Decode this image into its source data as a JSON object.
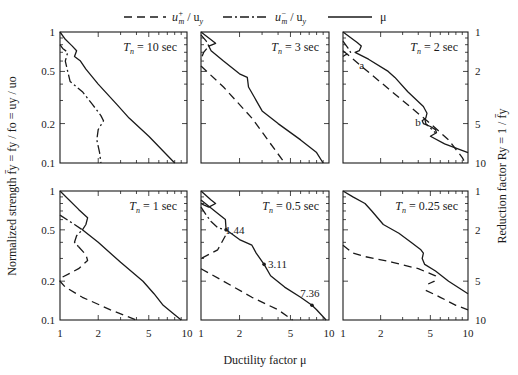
{
  "chart_data": {
    "type": "line",
    "title": "",
    "layout": {
      "rows": 2,
      "cols": 3,
      "xscale": "log",
      "yscale": "log",
      "grid": false,
      "legend_position": "top"
    },
    "legend": [
      {
        "label_main": "u",
        "label_sup": "+",
        "label_sub": "m",
        "label_tail": " / u",
        "label_tail_sub": "y",
        "style": "dashed",
        "name": "u_m+/u_y"
      },
      {
        "label_main": "u",
        "label_sup": "−",
        "label_sub": "m",
        "label_tail": " / u",
        "label_tail_sub": "y",
        "style": "dashdot",
        "name": "u_m-/u_y"
      },
      {
        "label_main": "μ",
        "style": "solid",
        "name": "mu"
      }
    ],
    "xlabel": "Ductility factor μ",
    "ylabel_left": "Normalized strength f̄y = fy / fo = uy / uo",
    "ylabel_right": "Reduction factor Ry = 1 / f̄y",
    "xlim": [
      1,
      10
    ],
    "ylim": [
      0.1,
      1
    ],
    "x_ticks": [
      "1",
      "2",
      "5",
      "10"
    ],
    "y_ticks_left": [
      "1",
      "0.5",
      "0.2",
      "0.1"
    ],
    "y_ticks_right": [
      "1",
      "2",
      "5",
      "10"
    ],
    "panels": [
      {
        "title": "T_n = 10 sec",
        "tn": "10 sec",
        "series": [
          {
            "name": "mu",
            "style": "solid",
            "points": [
              [
                1.0,
                1.0
              ],
              [
                1.1,
                0.88
              ],
              [
                1.25,
                0.78
              ],
              [
                1.35,
                0.72
              ],
              [
                1.3,
                0.65
              ],
              [
                1.45,
                0.6
              ],
              [
                1.6,
                0.52
              ],
              [
                2.0,
                0.4
              ],
              [
                2.8,
                0.28
              ],
              [
                3.5,
                0.22
              ],
              [
                5.0,
                0.16
              ],
              [
                8.0,
                0.1
              ]
            ]
          },
          {
            "name": "u_m-/u_y",
            "style": "dashdot",
            "points": [
              [
                1.0,
                0.8
              ],
              [
                1.05,
                0.75
              ],
              [
                1.15,
                0.7
              ],
              [
                1.1,
                0.6
              ],
              [
                1.15,
                0.5
              ],
              [
                1.2,
                0.42
              ],
              [
                1.5,
                0.35
              ],
              [
                1.8,
                0.28
              ],
              [
                2.1,
                0.23
              ],
              [
                2.2,
                0.21
              ],
              [
                2.0,
                0.18
              ],
              [
                1.95,
                0.15
              ],
              [
                2.05,
                0.12
              ],
              [
                2.1,
                0.1
              ]
            ]
          }
        ]
      },
      {
        "title": "T_n = 3 sec",
        "tn": "3 sec",
        "series": [
          {
            "name": "mu",
            "style": "solid",
            "points": [
              [
                1.0,
                1.0
              ],
              [
                1.3,
                0.82
              ],
              [
                1.15,
                0.78
              ],
              [
                1.2,
                0.72
              ],
              [
                1.5,
                0.6
              ],
              [
                2.0,
                0.48
              ],
              [
                2.3,
                0.45
              ],
              [
                2.35,
                0.38
              ],
              [
                2.6,
                0.32
              ],
              [
                3.0,
                0.25
              ],
              [
                4.0,
                0.2
              ],
              [
                6.0,
                0.15
              ],
              [
                8.0,
                0.12
              ],
              [
                9.0,
                0.1
              ]
            ]
          },
          {
            "name": "u_m-/u_y",
            "style": "dashdot",
            "points": [
              [
                1.0,
                0.95
              ],
              [
                1.1,
                0.85
              ],
              [
                1.15,
                0.78
              ],
              [
                1.05,
                0.7
              ],
              [
                1.0,
                0.62
              ]
            ]
          },
          {
            "name": "u_m+/u_y",
            "style": "dashed",
            "points": [
              [
                1.0,
                0.55
              ],
              [
                1.5,
                0.38
              ],
              [
                2.5,
                0.22
              ],
              [
                4.5,
                0.1
              ]
            ]
          }
        ]
      },
      {
        "title": "T_n = 2 sec",
        "tn": "2 sec",
        "annotations": [
          {
            "text": "a",
            "x": 1.3,
            "y": 0.58
          },
          {
            "text": "b",
            "x": 4.5,
            "y": 0.2
          }
        ],
        "series": [
          {
            "name": "mu",
            "style": "solid",
            "points": [
              [
                1.0,
                1.0
              ],
              [
                1.3,
                0.83
              ],
              [
                1.4,
                0.78
              ],
              [
                1.35,
                0.72
              ],
              [
                1.25,
                0.7
              ],
              [
                1.6,
                0.62
              ],
              [
                2.3,
                0.5
              ],
              [
                2.6,
                0.45
              ],
              [
                3.3,
                0.35
              ],
              [
                4.4,
                0.27
              ],
              [
                4.7,
                0.24
              ],
              [
                4.6,
                0.22
              ],
              [
                4.3,
                0.21
              ],
              [
                4.4,
                0.2
              ],
              [
                5.0,
                0.19
              ],
              [
                5.5,
                0.18
              ],
              [
                5.6,
                0.17
              ],
              [
                5.0,
                0.16
              ],
              [
                6.5,
                0.14
              ],
              [
                10.0,
                0.12
              ]
            ]
          },
          {
            "name": "u_m-/u_y",
            "style": "dashdot",
            "points": [
              [
                1.0,
                0.85
              ],
              [
                1.1,
                0.75
              ],
              [
                1.15,
                0.7
              ],
              [
                1.05,
                0.67
              ],
              [
                1.0,
                0.65
              ]
            ]
          },
          {
            "name": "u_m+/u_y",
            "style": "dashed",
            "points": [
              [
                1.0,
                0.72
              ],
              [
                1.5,
                0.52
              ],
              [
                3.0,
                0.3
              ],
              [
                5.0,
                0.2
              ],
              [
                7.0,
                0.15
              ],
              [
                9.0,
                0.11
              ],
              [
                9.5,
                0.1
              ]
            ]
          },
          {
            "name": "u_m-/u_y (b)",
            "style": "dashdot",
            "points": [
              [
                4.5,
                0.22
              ],
              [
                4.6,
                0.2
              ],
              [
                5.5,
                0.17
              ]
            ]
          }
        ]
      },
      {
        "title": "T_n = 1 sec",
        "tn": "1 sec",
        "series": [
          {
            "name": "mu",
            "style": "solid",
            "points": [
              [
                1.0,
                1.0
              ],
              [
                1.4,
                0.72
              ],
              [
                1.65,
                0.62
              ],
              [
                1.6,
                0.55
              ],
              [
                1.5,
                0.5
              ],
              [
                2.0,
                0.4
              ],
              [
                3.0,
                0.28
              ],
              [
                4.5,
                0.2
              ],
              [
                5.5,
                0.16
              ],
              [
                6.5,
                0.13
              ],
              [
                8.0,
                0.11
              ],
              [
                9.0,
                0.1
              ]
            ]
          },
          {
            "name": "u_m-/u_y",
            "style": "dashdot",
            "points": [
              [
                1.0,
                0.65
              ],
              [
                1.3,
                0.55
              ],
              [
                1.5,
                0.5
              ],
              [
                1.35,
                0.45
              ],
              [
                1.3,
                0.4
              ],
              [
                1.4,
                0.37
              ]
            ]
          },
          {
            "name": "u_m+/u_y",
            "style": "dashed",
            "points": [
              [
                1.4,
                0.37
              ],
              [
                1.6,
                0.32
              ],
              [
                1.65,
                0.29
              ],
              [
                1.4,
                0.25
              ],
              [
                1.0,
                0.21
              ],
              [
                1.0,
                0.2
              ],
              [
                1.1,
                0.18
              ],
              [
                1.5,
                0.15
              ],
              [
                2.5,
                0.12
              ],
              [
                4.0,
                0.1
              ]
            ]
          }
        ]
      },
      {
        "title": "T_n = 0.5 sec",
        "tn": "0.5 sec",
        "annotations": [
          {
            "text": "1.44",
            "x": 1.44,
            "y": 0.5
          },
          {
            "text": "3.11",
            "x": 3.11,
            "y": 0.27
          },
          {
            "text": "7.36",
            "x": 7.36,
            "y": 0.13
          }
        ],
        "markers": [
          [
            1.57,
            0.5
          ],
          [
            3.11,
            0.27
          ],
          [
            7.36,
            0.13
          ]
        ],
        "series": [
          {
            "name": "mu",
            "style": "solid",
            "points": [
              [
                1.0,
                1.0
              ],
              [
                1.2,
                0.85
              ],
              [
                1.3,
                0.8
              ],
              [
                1.15,
                0.75
              ],
              [
                1.05,
                0.78
              ],
              [
                1.0,
                0.8
              ]
            ]
          },
          {
            "name": "mu-main",
            "style": "solid",
            "points": [
              [
                1.0,
                0.85
              ],
              [
                1.4,
                0.65
              ],
              [
                1.55,
                0.6
              ],
              [
                1.57,
                0.5
              ],
              [
                2.0,
                0.42
              ],
              [
                2.5,
                0.38
              ],
              [
                2.7,
                0.33
              ],
              [
                3.11,
                0.27
              ],
              [
                3.5,
                0.22
              ],
              [
                4.5,
                0.18
              ],
              [
                6.0,
                0.15
              ],
              [
                7.36,
                0.13
              ],
              [
                8.0,
                0.12
              ],
              [
                9.5,
                0.1
              ]
            ]
          },
          {
            "name": "u_m-/u_y",
            "style": "dashdot",
            "points": [
              [
                1.0,
                0.75
              ],
              [
                1.1,
                0.65
              ],
              [
                1.2,
                0.58
              ],
              [
                1.35,
                0.52
              ],
              [
                1.55,
                0.5
              ]
            ]
          },
          {
            "name": "u_m+/u_y",
            "style": "dashed",
            "points": [
              [
                1.55,
                0.45
              ],
              [
                1.35,
                0.35
              ],
              [
                1.0,
                0.3
              ]
            ]
          },
          {
            "name": "u_m+/u_y-low",
            "style": "dashed",
            "points": [
              [
                1.0,
                0.25
              ],
              [
                1.5,
                0.2
              ],
              [
                2.5,
                0.15
              ],
              [
                4.0,
                0.12
              ],
              [
                5.2,
                0.1
              ]
            ]
          }
        ]
      },
      {
        "title": "T_n = 0.25 sec",
        "tn": "0.25 sec",
        "series": [
          {
            "name": "mu",
            "style": "solid",
            "points": [
              [
                1.0,
                1.0
              ],
              [
                1.2,
                0.9
              ],
              [
                1.5,
                0.8
              ],
              [
                1.7,
                0.7
              ],
              [
                2.1,
                0.55
              ],
              [
                2.8,
                0.47
              ],
              [
                3.5,
                0.4
              ],
              [
                4.2,
                0.35
              ],
              [
                4.4,
                0.33
              ],
              [
                4.3,
                0.3
              ],
              [
                4.5,
                0.27
              ],
              [
                5.5,
                0.24
              ],
              [
                7.0,
                0.2
              ],
              [
                10.0,
                0.16
              ]
            ]
          },
          {
            "name": "u_m+/u_y",
            "style": "dashed",
            "points": [
              [
                1.0,
                0.38
              ],
              [
                1.2,
                0.33
              ],
              [
                1.5,
                0.31
              ],
              [
                2.5,
                0.28
              ],
              [
                4.0,
                0.25
              ],
              [
                5.5,
                0.22
              ],
              [
                5.4,
                0.2
              ],
              [
                4.8,
                0.19
              ]
            ]
          },
          {
            "name": "u_m+/u_y-2",
            "style": "dashed",
            "points": [
              [
                4.6,
                0.17
              ],
              [
                6.0,
                0.15
              ],
              [
                8.0,
                0.13
              ],
              [
                10.0,
                0.12
              ]
            ]
          }
        ]
      }
    ]
  }
}
